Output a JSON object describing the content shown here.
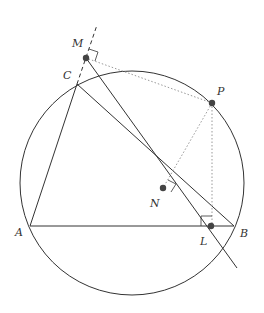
{
  "diagram": {
    "labels": {
      "M": "M",
      "C": "C",
      "P": "P",
      "N": "N",
      "A": "A",
      "L": "L",
      "B": "B"
    },
    "colors": {
      "line": "#333333",
      "dotted": "#999999",
      "point": "#444444"
    }
  }
}
